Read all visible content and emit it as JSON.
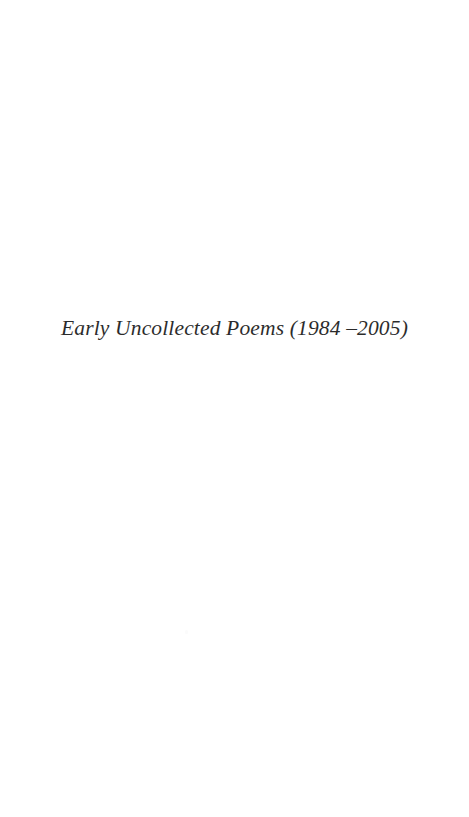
{
  "page": {
    "kind": "book-section-divider",
    "background_color": "#ffffff",
    "ink_color": "#1a1a1a",
    "width": 469,
    "height": 817
  },
  "section": {
    "title": "Early Uncollected Poems (1984 –2005)",
    "title_parts": {
      "label": "Early Uncollected Poems",
      "date_range": "(1984 –2005)",
      "year_start": "1984",
      "year_end": "2005"
    }
  }
}
